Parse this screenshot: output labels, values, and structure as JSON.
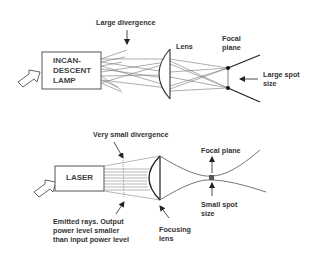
{
  "diagram": {
    "top": {
      "source_label": "INCAN-\nDESCENT\nLAMP",
      "divergence_label": "Large divergence",
      "lens_label": "Lens",
      "focal_plane_label": "Focal\nplane",
      "spot_label": "Large spot\nsize"
    },
    "bottom": {
      "source_label": "LASER",
      "divergence_label": "Very small divergence",
      "focal_plane_label": "Focal plane",
      "spot_label": "Small spot\nsize",
      "emitted_label": "Emitted rays. Output\npower level smaller\nthan input power level",
      "lens_label": "Focusing\nlens"
    },
    "colors": {
      "line": "#555555",
      "text": "#333333",
      "background": "#ffffff"
    }
  }
}
